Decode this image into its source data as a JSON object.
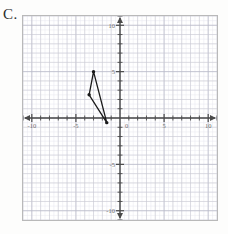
{
  "label": {
    "text": "C."
  },
  "chart_data": {
    "type": "scatter",
    "title": "",
    "xlabel": "",
    "ylabel": "",
    "xlim": [
      -11,
      11
    ],
    "ylim": [
      -11,
      11
    ],
    "grid": true,
    "minor_grid": true,
    "grid_step": 1,
    "tick_step": 1,
    "legend": "none",
    "axis_arrows": true,
    "xticks": [
      -10,
      -5,
      0,
      5,
      10
    ],
    "xticklabels": [
      "-10",
      "-5",
      "0",
      "5",
      "10"
    ],
    "yticks": [
      -10,
      -5,
      5,
      10
    ],
    "yticklabels": [
      "-10",
      "-5",
      "5",
      "10"
    ],
    "origin_label": "0",
    "shapes": [
      {
        "name": "triangle",
        "type": "polygon",
        "closed": true,
        "stroke": "#1a1a1a",
        "fill": "none",
        "points": [
          {
            "x": -3,
            "y": 5
          },
          {
            "x": -3.5,
            "y": 2.5
          },
          {
            "x": -1.5,
            "y": -0.5
          }
        ],
        "vertex_markers": true
      }
    ]
  },
  "colors": {
    "grid_major": "#c8c8d2",
    "grid_minor": "#e6e6ee",
    "axis": "#4a4a4a",
    "shape_stroke": "#1a1a1a",
    "frame": "#b9b9b9",
    "tick_text": "#6e6e6e"
  }
}
